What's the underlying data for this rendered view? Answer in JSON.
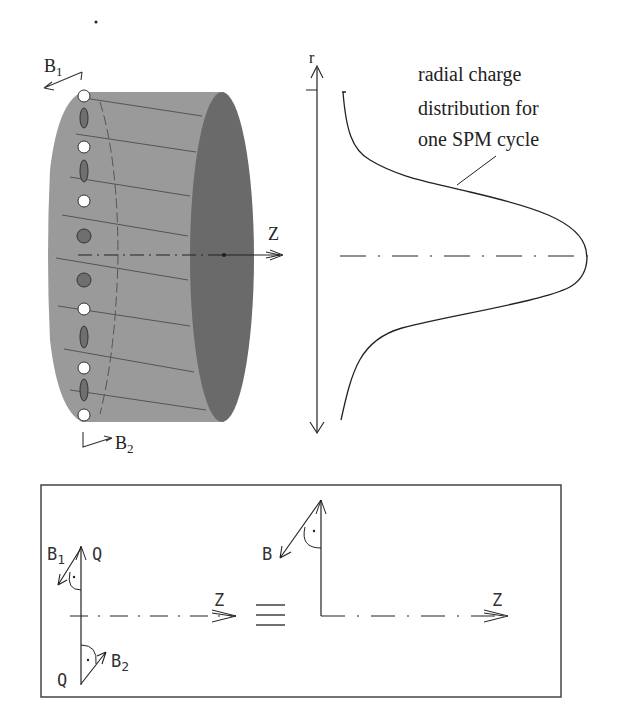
{
  "figure": {
    "upper_left": {
      "title": "charged cylinder with SPM dipole rings",
      "labels": {
        "b1": "B",
        "b1_sub": "1",
        "b2": "B",
        "b2_sub": "2",
        "z_axis": "Z"
      },
      "colors": {
        "cylinder_side": "#9a9a9a",
        "cylinder_end": "#6a6a6a",
        "hollow_dot": "#ffffff",
        "filled_dot": "#6f6f6f",
        "line": "#333333"
      },
      "dots": [
        {
          "y": 96,
          "kind": "hollow"
        },
        {
          "y": 116,
          "kind": "elongated"
        },
        {
          "y": 146,
          "kind": "hollow"
        },
        {
          "y": 168,
          "kind": "elongated"
        },
        {
          "y": 200,
          "kind": "hollow"
        },
        {
          "y": 236,
          "kind": "filled"
        },
        {
          "y": 280,
          "kind": "filled"
        },
        {
          "y": 309,
          "kind": "hollow"
        },
        {
          "y": 337,
          "kind": "elongated"
        },
        {
          "y": 368,
          "kind": "hollow"
        },
        {
          "y": 389,
          "kind": "elongated"
        },
        {
          "y": 415,
          "kind": "hollow"
        }
      ]
    },
    "upper_right": {
      "axis_label": "r",
      "annotation_line1": "radial charge",
      "annotation_line2": "distribution for",
      "annotation_line3": "one SPM cycle"
    },
    "lower_panel": {
      "left_group": {
        "b1": "B",
        "b1_sub": "1",
        "q_top": "Q",
        "q_bottom": "Q",
        "b2": "B",
        "b2_sub": "2",
        "z_axis": "Z"
      },
      "equivalence_symbol": "≡",
      "right_group": {
        "b": "B",
        "z_axis": "Z"
      }
    },
    "caption": ""
  }
}
